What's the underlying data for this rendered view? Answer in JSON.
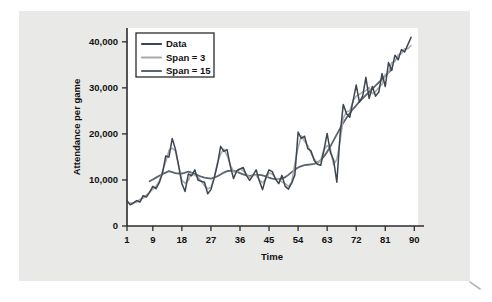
{
  "figure": {
    "panel_bg": "#e9e9e7",
    "page_bg": "#ffffff",
    "plot_bg": "#ffffff"
  },
  "chart_data": {
    "type": "line",
    "title": "",
    "subtitle": "",
    "xlabel": "Time",
    "ylabel": "Attendance per game",
    "xlim": [
      1,
      93
    ],
    "ylim": [
      0,
      43000
    ],
    "xticks": [
      1,
      9,
      18,
      27,
      36,
      45,
      54,
      63,
      72,
      81,
      90
    ],
    "xtick_labels": [
      "1",
      "9",
      "18",
      "27",
      "36",
      "45",
      "54",
      "63",
      "72",
      "81",
      "90"
    ],
    "yticks": [
      0,
      10000,
      20000,
      30000,
      40000
    ],
    "ytick_labels": [
      "0",
      "10,000",
      "20,000",
      "30,000",
      "40,000"
    ],
    "grid": false,
    "legend_position": "upper-left",
    "series": [
      {
        "name": "Data",
        "color": "#3d4550",
        "width": 1.5,
        "x_start": 1,
        "values": [
          5500,
          4600,
          5000,
          5500,
          5200,
          6600,
          6300,
          7300,
          8600,
          8100,
          9400,
          11500,
          15200,
          15000,
          19000,
          16700,
          13100,
          9200,
          7500,
          11300,
          10900,
          12200,
          10000,
          9700,
          9500,
          7000,
          7900,
          10400,
          13300,
          17300,
          16200,
          16600,
          13000,
          10300,
          12000,
          12400,
          12700,
          11000,
          9900,
          11000,
          12200,
          9800,
          7900,
          10500,
          12200,
          11800,
          10200,
          9200,
          11000,
          8600,
          8000,
          9300,
          11100,
          20400,
          19000,
          19500,
          16800,
          16300,
          14200,
          13400,
          13200,
          16400,
          20100,
          16000,
          14300,
          9500,
          19800,
          26400,
          24400,
          23600,
          27100,
          30600,
          26900,
          28200,
          32300,
          27700,
          30300,
          28200,
          29100,
          33100,
          30300,
          35500,
          33800,
          37100,
          36100,
          38300,
          37800,
          39400,
          41000
        ]
      },
      {
        "name": "Span = 3",
        "color": "#a9aaab",
        "width": 1.5,
        "x_start": 2,
        "values": [
          5000,
          5000,
          5200,
          5800,
          6000,
          6700,
          7400,
          8000,
          8700,
          9700,
          12000,
          13900,
          16400,
          16900,
          16300,
          13000,
          9900,
          9300,
          9900,
          11500,
          11000,
          10600,
          9700,
          8700,
          8100,
          8400,
          10500,
          13700,
          15600,
          16700,
          15300,
          13300,
          11800,
          11600,
          12400,
          12000,
          11200,
          10600,
          11000,
          11000,
          10000,
          9400,
          10200,
          11500,
          11300,
          10400,
          10100,
          9600,
          9200,
          8600,
          9500,
          13600,
          17000,
          19600,
          18400,
          17500,
          15800,
          14600,
          13600,
          14300,
          16600,
          17500,
          16800,
          13300,
          14500,
          18400,
          23500,
          24800,
          25000,
          27100,
          28200,
          28600,
          29100,
          29400,
          30100,
          28700,
          29200,
          30100,
          30800,
          32900,
          33200,
          35500,
          35700,
          37200,
          37400,
          38500,
          38500,
          39200
        ]
      },
      {
        "name": "Span = 15",
        "color": "#5b6470",
        "width": 1.8,
        "x_start": 8,
        "values": [
          9700,
          10100,
          10500,
          10900,
          11300,
          11600,
          11900,
          11700,
          11500,
          11400,
          11400,
          11600,
          11800,
          11600,
          11300,
          11000,
          10700,
          10500,
          10400,
          10300,
          10500,
          10800,
          11200,
          11600,
          11900,
          12000,
          12000,
          11800,
          11500,
          11200,
          11000,
          10900,
          11000,
          11100,
          11100,
          11000,
          10800,
          10500,
          10300,
          10200,
          10200,
          10300,
          10600,
          11100,
          11700,
          12200,
          12700,
          13000,
          13200,
          13300,
          13400,
          13500,
          13800,
          14300,
          15100,
          16100,
          17300,
          18600,
          19900,
          21200,
          22400,
          23500,
          24500,
          25400,
          26200,
          27000,
          27700,
          28400,
          29100,
          29800,
          30500,
          31200,
          31900,
          32600,
          33300,
          34000
        ]
      }
    ]
  },
  "legend": {
    "items": [
      {
        "label": "Data",
        "color": "#3d4550"
      },
      {
        "label": "Span = 3",
        "color": "#a9aaab"
      },
      {
        "label": "Span = 15",
        "color": "#5b6470"
      }
    ]
  }
}
